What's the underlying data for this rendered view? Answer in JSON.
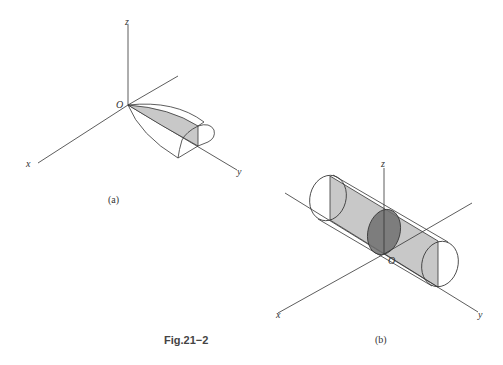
{
  "figure": {
    "caption": "Fig.21−2",
    "panels": [
      {
        "id": "a",
        "caption": "(a)",
        "axis_labels": {
          "x": "x",
          "y": "y",
          "z": "z",
          "origin": "O"
        },
        "description": "Solid bounded by paraboloid-like curved surfaces from origin along y axis, with shaded planar cross-section"
      },
      {
        "id": "b",
        "caption": "(b)",
        "axis_labels": {
          "x": "x",
          "y": "y",
          "z": "z",
          "origin": "O"
        },
        "description": "Cylinder along y axis with shaded rectangular axial section and dark elliptical cross-section through origin"
      }
    ],
    "colors": {
      "line": "#333333",
      "shade_light": "#c8c8c8",
      "shade_dark": "#707070",
      "background": "#ffffff"
    }
  }
}
